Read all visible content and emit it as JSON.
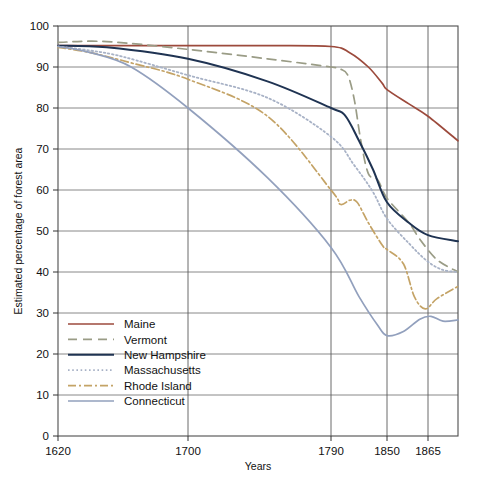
{
  "chart_data": {
    "type": "line",
    "title": "",
    "xlabel": "Years",
    "ylabel": "Estimated percentage of forest area",
    "xlim": [
      1620,
      1875
    ],
    "ylim": [
      0,
      100
    ],
    "grid": true,
    "legend_position": "inside-lower-left",
    "xticks": [
      1620,
      1700,
      1790,
      1850,
      1865
    ],
    "xtick_labels": [
      "1620",
      "1700",
      "1790",
      "1850",
      "1865"
    ],
    "yticks": [
      0,
      10,
      20,
      30,
      40,
      50,
      60,
      70,
      80,
      90,
      100
    ],
    "ytick_labels": [
      "0",
      "10",
      "20",
      "30",
      "40",
      "50",
      "60",
      "70",
      "80",
      "90",
      "100"
    ],
    "series": [
      {
        "name": "Maine",
        "color": "#9c4a3c",
        "dash": "none",
        "width": 1.7,
        "x": [
          1620,
          1660,
          1700,
          1750,
          1790,
          1810,
          1830,
          1845,
          1850,
          1858,
          1865,
          1875
        ],
        "values": [
          95.2,
          95.2,
          95.2,
          95.2,
          95.0,
          93.5,
          90.0,
          86.0,
          84.5,
          81.0,
          78.0,
          72.0
        ]
      },
      {
        "name": "Vermont",
        "color": "#9a9c86",
        "dash": "9,6",
        "width": 1.7,
        "x": [
          1620,
          1650,
          1700,
          1750,
          1790,
          1800,
          1808,
          1815,
          1822,
          1830,
          1840,
          1850,
          1858,
          1862,
          1868,
          1875
        ],
        "values": [
          96.0,
          96.2,
          94.3,
          92.0,
          90.0,
          89.5,
          88.0,
          82.0,
          72.0,
          64.0,
          62.5,
          58.0,
          52.0,
          48.0,
          43.0,
          40.0
        ]
      },
      {
        "name": "New Hampshire",
        "color": "#1f3352",
        "dash": "none",
        "width": 2.0,
        "x": [
          1620,
          1650,
          1700,
          1750,
          1790,
          1805,
          1820,
          1835,
          1850,
          1858,
          1865,
          1875
        ],
        "values": [
          95.2,
          94.8,
          92.0,
          86.5,
          80.0,
          78.2,
          72.0,
          65.0,
          57.0,
          52.0,
          49.0,
          47.5
        ]
      },
      {
        "name": "Massachusetts",
        "color": "#a8b2c6",
        "dash": "1.6,2.6",
        "width": 1.8,
        "x": [
          1620,
          1640,
          1660,
          1700,
          1750,
          1790,
          1815,
          1835,
          1850,
          1858,
          1865,
          1870,
          1875
        ],
        "values": [
          95.0,
          94.0,
          92.5,
          88.0,
          82.5,
          73.0,
          66.0,
          59.5,
          53.0,
          47.0,
          42.5,
          40.5,
          40.0
        ]
      },
      {
        "name": "Rhode Island",
        "color": "#c4a366",
        "dash": "8,3,2,3",
        "width": 1.7,
        "x": [
          1620,
          1640,
          1665,
          1700,
          1750,
          1790,
          1800,
          1810,
          1818,
          1830,
          1845,
          1850,
          1856,
          1860,
          1864,
          1868,
          1875
        ],
        "values": [
          94.8,
          93.5,
          91.0,
          87.0,
          78.0,
          60.0,
          56.5,
          57.5,
          57.0,
          52.0,
          46.5,
          45.5,
          42.0,
          34.0,
          31.0,
          33.5,
          36.5
        ]
      },
      {
        "name": "Connecticut",
        "color": "#92a0bd",
        "dash": "none",
        "width": 1.7,
        "x": [
          1620,
          1640,
          1665,
          1700,
          1750,
          1790,
          1820,
          1840,
          1850,
          1856,
          1862,
          1866,
          1870,
          1875
        ],
        "values": [
          95.0,
          93.5,
          90.0,
          80.0,
          63.0,
          46.0,
          34.0,
          27.0,
          24.5,
          25.5,
          28.5,
          29.2,
          28.0,
          28.3
        ]
      }
    ]
  }
}
